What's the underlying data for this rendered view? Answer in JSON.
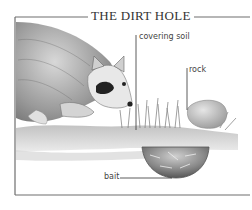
{
  "diagram": {
    "title": "THE DIRT HOLE",
    "labels": {
      "covering_soil": "covering soil",
      "rock": "rock",
      "bait": "bait"
    },
    "subjects": [
      "raccoon",
      "grass",
      "rock",
      "covering soil",
      "bait hole"
    ],
    "colors": {
      "ink": "#333333",
      "frame": "#666666",
      "background": "#ffffff"
    }
  }
}
